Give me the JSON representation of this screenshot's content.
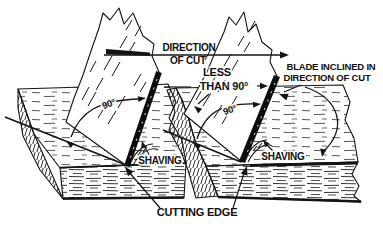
{
  "colors": {
    "paper": "#ffffff",
    "ink": "#141414"
  },
  "labels": {
    "direction1": "DIRECTION",
    "direction2": "OF CUT",
    "less": "LESS",
    "than90": "THAN 90°",
    "inclined1": "BLADE INCLINED IN",
    "inclined2": "DIRECTION OF CUT",
    "angle_left": "90°",
    "angle_right": "90°",
    "shaving_left": "SHAVING",
    "shaving_right": "SHAVING",
    "cutting_edge": "CUTTING EDGE"
  }
}
